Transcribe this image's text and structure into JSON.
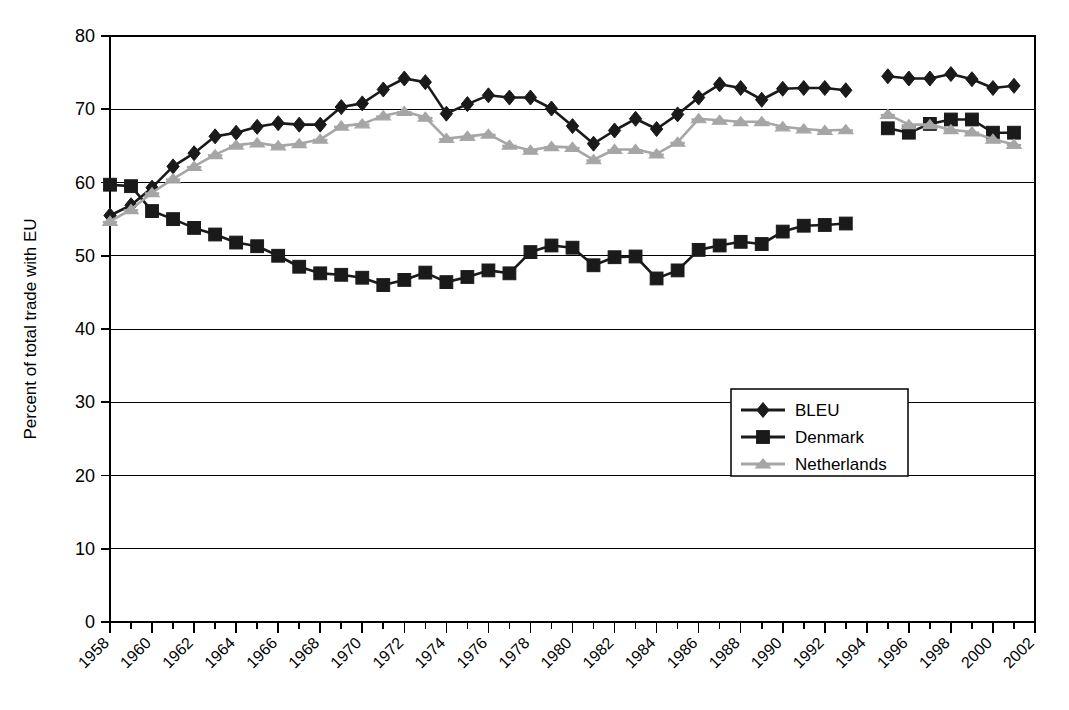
{
  "chart_data": {
    "type": "line",
    "title": "",
    "subtitle": "",
    "xlabel": "",
    "ylabel": "Percent of total trade with EU",
    "ylim": [
      0,
      80
    ],
    "ytick_step": 10,
    "yticks": [
      "0",
      "10",
      "20",
      "30",
      "40",
      "50",
      "60",
      "70",
      "80"
    ],
    "xlim": [
      1958,
      2002
    ],
    "xticks": [
      "1958",
      "1960",
      "1962",
      "1964",
      "1966",
      "1968",
      "1970",
      "1972",
      "1974",
      "1976",
      "1978",
      "1980",
      "1982",
      "1984",
      "1986",
      "1988",
      "1990",
      "1992",
      "1994",
      "1996",
      "1998",
      "2000",
      "2002"
    ],
    "xtick_step": 2,
    "minor_xtick_step": 1,
    "grid": "horizontal",
    "legend_position": "center-right",
    "x": [
      1958,
      1959,
      1960,
      1961,
      1962,
      1963,
      1964,
      1965,
      1966,
      1967,
      1968,
      1969,
      1970,
      1971,
      1972,
      1973,
      1974,
      1975,
      1976,
      1977,
      1978,
      1979,
      1980,
      1981,
      1982,
      1983,
      1984,
      1985,
      1986,
      1987,
      1988,
      1989,
      1990,
      1991,
      1992,
      1993,
      1995,
      1996,
      1997,
      1998,
      1999,
      2000,
      2001
    ],
    "series": [
      {
        "name": "BLEU",
        "color": "#1a1a1a",
        "marker": "diamond",
        "values": [
          55.5,
          56.9,
          59.3,
          62.2,
          64.0,
          66.3,
          66.8,
          67.6,
          68.1,
          67.9,
          67.9,
          70.3,
          70.8,
          72.7,
          74.2,
          73.7,
          69.4,
          70.7,
          71.9,
          71.6,
          71.6,
          70.1,
          67.7,
          65.3,
          67.1,
          68.7,
          67.3,
          69.3,
          71.6,
          73.4,
          72.9,
          71.3,
          72.8,
          72.9,
          72.9,
          72.6,
          74.5,
          74.2,
          74.2,
          74.8,
          74.1,
          72.9,
          73.2
        ]
      },
      {
        "name": "Denmark",
        "color": "#1a1a1a",
        "marker": "square",
        "values": [
          59.7,
          59.5,
          56.1,
          55.0,
          53.8,
          52.9,
          51.8,
          51.3,
          50.0,
          48.5,
          47.6,
          47.4,
          47.0,
          46.0,
          46.7,
          47.7,
          46.4,
          47.1,
          48.0,
          47.6,
          50.5,
          51.4,
          51.1,
          48.7,
          49.8,
          49.9,
          46.9,
          48.0,
          50.8,
          51.4,
          51.9,
          51.6,
          53.3,
          54.1,
          54.2,
          54.4,
          67.4,
          66.8,
          68.0,
          68.6,
          68.6,
          66.8,
          66.8
        ]
      },
      {
        "name": "Netherlands",
        "color": "#a6a6a6",
        "marker": "star",
        "values": [
          54.7,
          56.3,
          58.6,
          60.5,
          62.2,
          63.8,
          65.1,
          65.4,
          65.0,
          65.3,
          65.9,
          67.7,
          68.0,
          69.1,
          69.7,
          68.9,
          66.0,
          66.3,
          66.6,
          65.1,
          64.4,
          64.9,
          64.8,
          63.1,
          64.5,
          64.5,
          63.9,
          65.5,
          68.7,
          68.5,
          68.3,
          68.3,
          67.6,
          67.3,
          67.1,
          67.2,
          69.3,
          67.9,
          67.9,
          67.2,
          66.9,
          65.9,
          65.2
        ]
      }
    ]
  },
  "legend": {
    "items": [
      {
        "label": "BLEU",
        "marker": "diamond-marker",
        "color": "#1a1a1a"
      },
      {
        "label": "Denmark",
        "marker": "square-marker",
        "color": "#1a1a1a"
      },
      {
        "label": "Netherlands",
        "marker": "star-marker",
        "color": "#a6a6a6"
      }
    ]
  }
}
